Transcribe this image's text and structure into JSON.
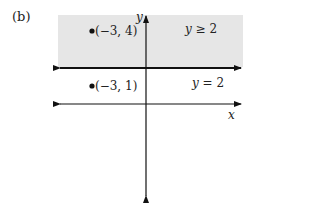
{
  "figure_label": "(b)",
  "region": {
    "label_var": "y",
    "label_rest": " ≥ 2",
    "fill": "#e6e6e6"
  },
  "boundary": {
    "label_var": "y",
    "label_rest": " = 2"
  },
  "axes": {
    "x_label": "x",
    "y_label": "y"
  },
  "points": [
    {
      "label": "(−3, 4)"
    },
    {
      "label": "(−3, 1)"
    }
  ]
}
